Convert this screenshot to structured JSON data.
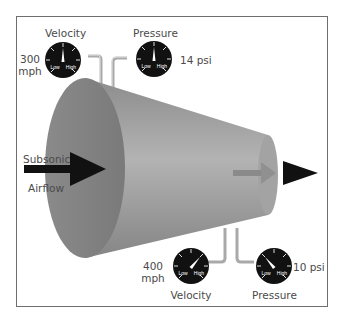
{
  "diagram": {
    "inlet": {
      "flow_label_line1": "Subsonic",
      "flow_label_line2": "Airflow",
      "velocity": {
        "label": "Velocity",
        "value_line1": "300",
        "value_line2": "mph",
        "needle": "mid"
      },
      "pressure": {
        "label": "Pressure",
        "value": "14 psi",
        "needle": "mid"
      }
    },
    "outlet": {
      "velocity": {
        "label": "Velocity",
        "value_line1": "400",
        "value_line2": "mph",
        "needle": "high"
      },
      "pressure": {
        "label": "Pressure",
        "value": "10 psi",
        "needle": "low"
      }
    },
    "gauge": {
      "low_label": "Low",
      "high_label": "High"
    },
    "colors": {
      "gauge_face": "#111111",
      "nozzle": "#9a9a9a",
      "pipe": "#a8a8a8",
      "arrow": "#111111"
    }
  }
}
